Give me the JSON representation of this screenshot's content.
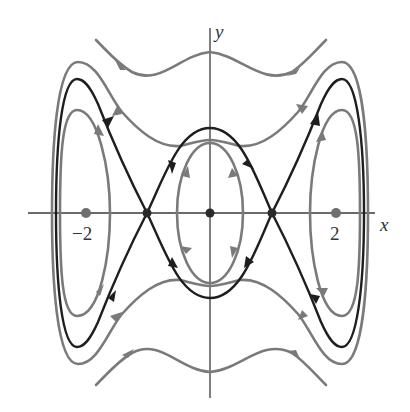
{
  "figure": {
    "type": "phase-portrait",
    "axes": {
      "x_label": "x",
      "y_label": "y",
      "tick_labels": [
        {
          "value": -2,
          "text": "−2"
        },
        {
          "value": 2,
          "text": "2"
        }
      ]
    },
    "equilibria": [
      {
        "kind": "center",
        "x": -2,
        "y": 0
      },
      {
        "kind": "saddle",
        "x": -1,
        "y": 0
      },
      {
        "kind": "center",
        "x": 0,
        "y": 0
      },
      {
        "kind": "saddle",
        "x": 1,
        "y": 0
      },
      {
        "kind": "center",
        "x": 2,
        "y": 0
      }
    ],
    "curves": [
      {
        "name": "separatrix",
        "style": "dark",
        "description": "heteroclinic loops connecting saddles at x=±1, enclosing centers at -2, 0, 2"
      },
      {
        "name": "inner-orbit-center-0",
        "style": "gray",
        "direction": "clockwise"
      },
      {
        "name": "inner-orbit-center-left",
        "style": "gray"
      },
      {
        "name": "inner-orbit-center-right",
        "style": "gray"
      },
      {
        "name": "outer-orbit",
        "style": "gray"
      },
      {
        "name": "top-wave-trajectory",
        "style": "gray",
        "direction": "left-to-right"
      },
      {
        "name": "bottom-wave-trajectory",
        "style": "gray",
        "direction": "right-to-left"
      }
    ],
    "colors": {
      "separatrix": "#1e1e1e",
      "orbits": "#7a7a7a",
      "axes": "#3a3a3a",
      "background": "#ffffff"
    }
  }
}
